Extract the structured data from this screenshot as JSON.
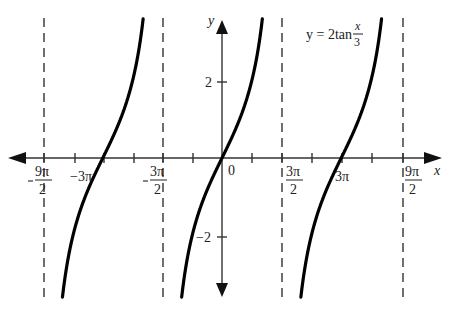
{
  "chart_data": {
    "type": "line",
    "function": "y = 2*tan(x/3)",
    "xlabel": "x",
    "ylabel": "y",
    "equation_label": {
      "lhs": "y = 2tan",
      "num": "x",
      "den": "3"
    },
    "x_ticks": [
      {
        "label_num": "9π",
        "label_den": "2",
        "sign": "-",
        "value": -14.137
      },
      {
        "label": "-3π",
        "value": -9.425
      },
      {
        "label_num": "3π",
        "label_den": "2",
        "sign": "-",
        "value": -4.712
      },
      {
        "label": "0",
        "value": 0
      },
      {
        "label_num": "3π",
        "label_den": "2",
        "sign": "",
        "value": 4.712
      },
      {
        "label": "3π",
        "value": 9.425
      },
      {
        "label_num": "9π",
        "label_den": "2",
        "sign": "",
        "value": 14.137
      }
    ],
    "y_ticks": [
      {
        "label": "2",
        "value": 2
      },
      {
        "label": "−2",
        "value": -2
      }
    ],
    "asymptotes": [
      "-9π/2",
      "-3π/2",
      "3π/2",
      "9π/2"
    ],
    "zeros": [
      "-3π",
      "0",
      "3π"
    ],
    "period": "3π",
    "xlim": [
      -15.5,
      16.5
    ],
    "ylim": [
      -4.2,
      4.2
    ],
    "grid": false,
    "legend": null
  },
  "labels": {
    "x_axis": "x",
    "y_axis": "y",
    "origin": "0",
    "neg3pi": "−3π",
    "pos3pi": "3π",
    "neg9pi_num": "9π",
    "neg9pi_den": "2",
    "neg3pi2_num": "3π",
    "neg3pi2_den": "2",
    "pos3pi2_num": "3π",
    "pos3pi2_den": "2",
    "pos9pi2_num": "9π",
    "pos9pi2_den": "2",
    "y_pos2": "2",
    "y_neg2": "−2",
    "eq_lhs": "y = 2tan",
    "eq_num": "x",
    "eq_den": "3"
  }
}
